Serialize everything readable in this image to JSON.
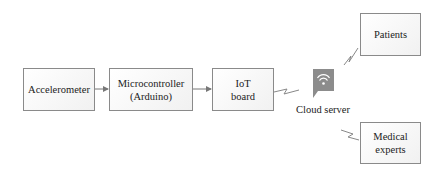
{
  "diagram": {
    "nodes": [
      {
        "id": "accelerometer",
        "label": "Accelerometer"
      },
      {
        "id": "microcontroller",
        "label_line1": "Microcontroller",
        "label_line2": "(Arduino)"
      },
      {
        "id": "iot_board",
        "label_line1": "IoT",
        "label_line2": "board"
      },
      {
        "id": "cloud_server",
        "label": "Cloud server",
        "icon": "wifi-icon"
      },
      {
        "id": "patients",
        "label": "Patients"
      },
      {
        "id": "medical_experts",
        "label_line1": "Medical",
        "label_line2": "experts"
      }
    ],
    "edges": [
      {
        "from": "accelerometer",
        "to": "microcontroller",
        "type": "arrow"
      },
      {
        "from": "microcontroller",
        "to": "iot_board",
        "type": "arrow"
      },
      {
        "from": "iot_board",
        "to": "cloud_server",
        "type": "wireless"
      },
      {
        "from": "cloud_server",
        "to": "patients",
        "type": "wireless"
      },
      {
        "from": "cloud_server",
        "to": "medical_experts",
        "type": "wireless"
      }
    ],
    "colors": {
      "box_border": "#8a8a8a",
      "icon_fill": "#8c8c8c",
      "line": "#777777"
    }
  }
}
